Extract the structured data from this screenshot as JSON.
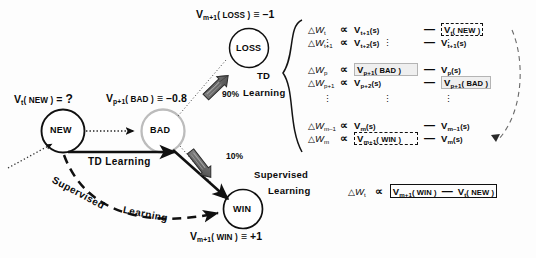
{
  "figure": {
    "accent_gray": "#b4b4b4",
    "ink": "#101010"
  },
  "graph": {
    "nodes": [
      {
        "id": "new",
        "label": "NEW",
        "value_label_prefix": "V",
        "value_label_sub": "t",
        "value_label_paren": "( NEW )",
        "value_label_eq": "= ",
        "value_label_value": "?"
      },
      {
        "id": "bad",
        "label": "BAD",
        "value_label_prefix": "V",
        "value_label_sub": "p+1",
        "value_label_paren": "( BAD )",
        "value_label_eq": "≡ ",
        "value_label_value": "–0.8"
      },
      {
        "id": "loss",
        "label": "LOSS",
        "value_label_prefix": "V",
        "value_label_sub": "m+1",
        "value_label_paren": "( LOSS )",
        "value_label_eq": "≡ ",
        "value_label_value": "–1"
      },
      {
        "id": "win",
        "label": "WIN",
        "value_label_prefix": "V",
        "value_label_sub": "m+1",
        "value_label_paren": "( WIN )",
        "value_label_eq": "≡ ",
        "value_label_value": "+1"
      }
    ],
    "edges": [
      {
        "id": "td-arrow",
        "label": "TD    Learning"
      },
      {
        "id": "supervised-arc",
        "label_part1": "Supervised",
        "label_part2": "Learning"
      }
    ],
    "branch_probabilities": [
      {
        "id": "loss-branch",
        "label": "90%"
      },
      {
        "id": "win-branch",
        "label": "10%"
      }
    ]
  },
  "td_block": {
    "group_label_line1": "TD",
    "group_label_line2": "Learning",
    "rows": [
      {
        "dw_sub": "t",
        "lhs_term": "V",
        "lhs_sub": "t+1",
        "lhs_paren": "(s)",
        "lhs_style": "plain",
        "rhs_term": "V",
        "rhs_sub": "t",
        "rhs_paren": "( NEW )",
        "rhs_style": "dashed"
      },
      {
        "dw_sub": "t+1",
        "lhs_term": "V",
        "lhs_sub": "t+2",
        "lhs_paren": "(s)",
        "lhs_style": "plain",
        "rhs_term": "V",
        "rhs_sub": "t+1",
        "rhs_paren": "(s)",
        "rhs_style": "plain"
      },
      {
        "dw_sub": "p",
        "lhs_term": "V",
        "lhs_sub": "p+1",
        "lhs_paren": "( BAD )",
        "lhs_style": "gray",
        "rhs_term": "V",
        "rhs_sub": "p",
        "rhs_paren": "(s)",
        "rhs_style": "plain"
      },
      {
        "dw_sub": "p+1",
        "lhs_term": "V",
        "lhs_sub": "p+2",
        "lhs_paren": "(s)",
        "lhs_style": "plain",
        "rhs_term": "V",
        "rhs_sub": "p+1",
        "rhs_paren": "( BAD )",
        "rhs_style": "gray"
      },
      {
        "dw_sub": "m–1",
        "lhs_term": "V",
        "lhs_sub": "m",
        "lhs_paren": "(s)",
        "lhs_style": "plain",
        "rhs_term": "V",
        "rhs_sub": "m–1",
        "rhs_paren": "(s)",
        "rhs_style": "plain"
      },
      {
        "dw_sub": "m",
        "lhs_term": "V",
        "lhs_sub": "m+1",
        "lhs_paren": "( WIN )",
        "lhs_style": "dashed",
        "rhs_term": "V",
        "rhs_sub": "m",
        "rhs_paren": "(s)",
        "rhs_style": "plain"
      }
    ],
    "delta_symbol": "△",
    "w_symbol": "W",
    "proportional_symbol": "∝",
    "minus_symbol": "—"
  },
  "supervised_block": {
    "group_label_line1": "Supervised",
    "group_label_line2": "Learning",
    "equation": {
      "dw_sub": "t",
      "lhs_term": "V",
      "lhs_sub": "m+1",
      "lhs_paren": "( WIN )",
      "rhs_term": "V",
      "rhs_sub": "t",
      "rhs_paren": "( NEW )"
    }
  }
}
